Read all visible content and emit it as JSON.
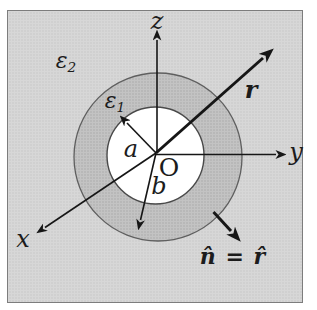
{
  "figure": {
    "type": "physics-diagram",
    "colors": {
      "background": "#ffffff",
      "outer_region_fill": "#d7d7d7",
      "outer_region_dot": "#c6c6c6",
      "shell_region_fill": "#c3c3c3",
      "shell_region_dot": "#ababab",
      "inner_region_fill": "#ffffff",
      "arrow_line": "#161616",
      "circle_stroke": "#5f5f5f",
      "panel_border": "#7d7d7d"
    },
    "labels": {
      "outer_permittivity": {
        "base": "ε",
        "sub": "2"
      },
      "shell_permittivity": {
        "base": "ε",
        "sub": "1"
      },
      "axis_z": "z",
      "axis_y": "y",
      "axis_x": "x",
      "radius_inner": "a",
      "radius_outer": "b",
      "origin": "O",
      "position_vector": "r",
      "normal_vector": "n̂ = r̂"
    }
  }
}
